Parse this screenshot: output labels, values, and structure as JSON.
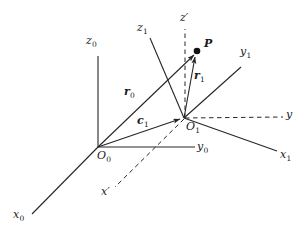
{
  "figure": {
    "background_color": "#ffffff",
    "line_color": "#262626",
    "label_color": "#1a1a1a",
    "width": 307,
    "height": 239
  },
  "points": {
    "origin_0": {
      "label": "O",
      "subscript": "0",
      "x": 98,
      "y": 147
    },
    "origin_1": {
      "label": "O",
      "subscript": "1",
      "x": 184,
      "y": 118
    },
    "point_p": {
      "label": "P",
      "x": 197,
      "y": 51
    }
  },
  "axes": [
    {
      "name": "z0",
      "label": "z",
      "subscript": "0",
      "style": "solid",
      "label_x": 86,
      "label_y": 41
    },
    {
      "name": "x0",
      "label": "x",
      "subscript": "0",
      "style": "solid",
      "label_x": 13,
      "label_y": 215
    },
    {
      "name": "y0",
      "label": "y",
      "subscript": "0",
      "style": "solid",
      "label_x": 197,
      "label_y": 146
    },
    {
      "name": "z1",
      "label": "z",
      "subscript": "1",
      "style": "solid",
      "label_x": 137,
      "label_y": 27
    },
    {
      "name": "x1",
      "label": "x",
      "subscript": "1",
      "style": "solid",
      "label_x": 280,
      "label_y": 155
    },
    {
      "name": "y1",
      "label": "y",
      "subscript": "1",
      "style": "solid",
      "label_x": 240,
      "label_y": 51
    },
    {
      "name": "z-prime",
      "label": "z′",
      "style": "dashed",
      "label_x": 180,
      "label_y": 16
    },
    {
      "name": "x-prime",
      "label": "x′",
      "style": "dashed",
      "label_x": 101,
      "label_y": 190
    },
    {
      "name": "y-prime",
      "label": "y",
      "style": "dashed",
      "label_x": 286,
      "label_y": 113
    }
  ],
  "vectors": [
    {
      "name": "r0",
      "label": "r",
      "subscript": "0",
      "from": "O0",
      "to": "P",
      "label_x": 124,
      "label_y": 91
    },
    {
      "name": "r1",
      "label": "r",
      "subscript": "1",
      "from": "O1",
      "to": "P",
      "label_x": 194,
      "label_y": 75
    },
    {
      "name": "c1",
      "label": "c",
      "subscript": "1",
      "from": "O0",
      "to": "O1",
      "label_x": 137,
      "label_y": 120
    }
  ]
}
